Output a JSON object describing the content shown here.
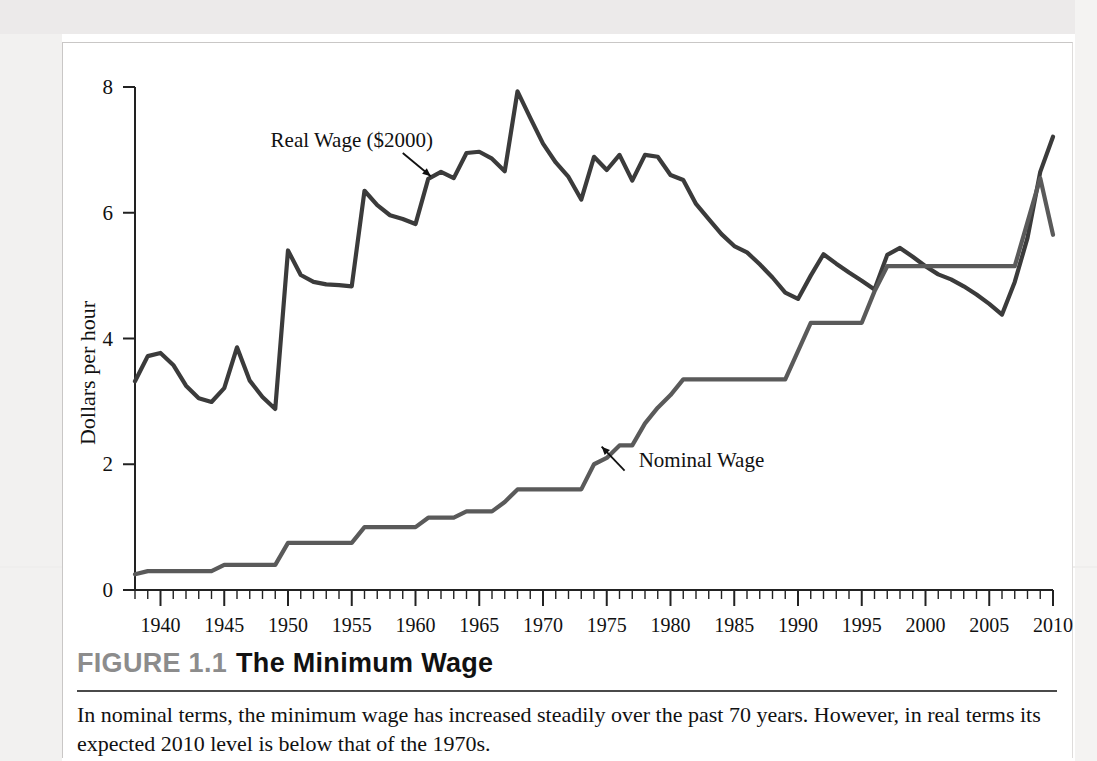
{
  "figure": {
    "number_label": "FIGURE 1.1",
    "title": "The Minimum Wage",
    "caption": "In nominal terms, the minimum wage has increased steadily over the past 70 years. However, in real terms its expected 2010 level is below that of the 1970s."
  },
  "chart_data": {
    "type": "line",
    "title": "The Minimum Wage",
    "xlabel": "",
    "ylabel": "Dollars per hour",
    "xlim": [
      1938,
      2010
    ],
    "ylim": [
      0,
      8
    ],
    "ytick_labels": [
      "0",
      "2",
      "4",
      "6",
      "8"
    ],
    "ytick_values": [
      0,
      2,
      4,
      6,
      8
    ],
    "xtick_labels": [
      "1940",
      "1945",
      "1950",
      "1955",
      "1960",
      "1965",
      "1970",
      "1975",
      "1980",
      "1985",
      "1990",
      "1995",
      "2000",
      "2005",
      "2010"
    ],
    "xtick_values": [
      1940,
      1945,
      1950,
      1955,
      1960,
      1965,
      1970,
      1975,
      1980,
      1985,
      1990,
      1995,
      2000,
      2005,
      2010
    ],
    "minor_tick_interval": 1,
    "grid": false,
    "legend_position": "inline-annotations",
    "colors": {
      "real_wage": "#3b3b3b",
      "nominal_wage": "#5a5a5a",
      "axis": "#222222",
      "figure_number": "#8c8c8c"
    },
    "annotations": [
      {
        "text": "Real Wage ($2000)",
        "points_to_series": "Real Wage ($2000)",
        "x": 1955.0,
        "y": 7.05
      },
      {
        "text": "Nominal Wage",
        "points_to_series": "Nominal Wage",
        "x": 1977.5,
        "y": 1.95
      }
    ],
    "series": [
      {
        "name": "Real Wage ($2000)",
        "color": "#3b3b3b",
        "x": [
          1938,
          1939,
          1940,
          1941,
          1942,
          1943,
          1944,
          1945,
          1946,
          1947,
          1948,
          1949,
          1950,
          1951,
          1952,
          1953,
          1954,
          1955,
          1956,
          1957,
          1958,
          1959,
          1960,
          1961,
          1962,
          1963,
          1964,
          1965,
          1966,
          1967,
          1968,
          1969,
          1970,
          1971,
          1972,
          1973,
          1974,
          1975,
          1976,
          1977,
          1978,
          1979,
          1980,
          1981,
          1982,
          1983,
          1984,
          1985,
          1986,
          1987,
          1988,
          1989,
          1990,
          1991,
          1992,
          1993,
          1994,
          1995,
          1996,
          1997,
          1998,
          1999,
          2000,
          2001,
          2002,
          2003,
          2004,
          2005,
          2006,
          2007,
          2008,
          2009,
          2010
        ],
        "y": [
          3.32,
          3.72,
          3.77,
          3.58,
          3.25,
          3.05,
          2.99,
          3.21,
          3.86,
          3.33,
          3.07,
          2.88,
          5.4,
          5.01,
          4.9,
          4.86,
          4.85,
          4.83,
          6.35,
          6.12,
          5.96,
          5.9,
          5.82,
          6.54,
          6.65,
          6.55,
          6.95,
          6.97,
          6.86,
          6.66,
          7.93,
          7.51,
          7.1,
          6.8,
          6.57,
          6.21,
          6.89,
          6.68,
          6.92,
          6.51,
          6.92,
          6.89,
          6.6,
          6.52,
          6.14,
          5.9,
          5.66,
          5.47,
          5.37,
          5.18,
          4.97,
          4.73,
          4.63,
          5.0,
          5.34,
          5.19,
          5.05,
          4.92,
          4.78,
          5.33,
          5.44,
          5.3,
          5.15,
          5.02,
          4.94,
          4.83,
          4.7,
          4.55,
          4.38,
          4.9,
          5.6,
          6.65,
          7.21
        ]
      },
      {
        "name": "Nominal Wage",
        "color": "#5a5a5a",
        "x": [
          1938,
          1939,
          1940,
          1941,
          1942,
          1943,
          1944,
          1945,
          1946,
          1947,
          1948,
          1949,
          1950,
          1951,
          1952,
          1953,
          1954,
          1955,
          1956,
          1957,
          1958,
          1959,
          1960,
          1961,
          1962,
          1963,
          1964,
          1965,
          1966,
          1967,
          1968,
          1969,
          1970,
          1971,
          1972,
          1973,
          1974,
          1975,
          1976,
          1977,
          1978,
          1979,
          1980,
          1981,
          1982,
          1983,
          1984,
          1985,
          1986,
          1987,
          1988,
          1989,
          1990,
          1991,
          1992,
          1993,
          1994,
          1995,
          1996,
          1997,
          1998,
          1999,
          2000,
          2001,
          2002,
          2003,
          2004,
          2005,
          2006,
          2007,
          2008,
          2009,
          2010
        ],
        "y": [
          0.25,
          0.3,
          0.3,
          0.3,
          0.3,
          0.3,
          0.3,
          0.4,
          0.4,
          0.4,
          0.4,
          0.4,
          0.75,
          0.75,
          0.75,
          0.75,
          0.75,
          0.75,
          1.0,
          1.0,
          1.0,
          1.0,
          1.0,
          1.15,
          1.15,
          1.15,
          1.25,
          1.25,
          1.25,
          1.4,
          1.6,
          1.6,
          1.6,
          1.6,
          1.6,
          1.6,
          2.0,
          2.1,
          2.3,
          2.3,
          2.65,
          2.9,
          3.1,
          3.35,
          3.35,
          3.35,
          3.35,
          3.35,
          3.35,
          3.35,
          3.35,
          3.35,
          3.8,
          4.25,
          4.25,
          4.25,
          4.25,
          4.25,
          4.75,
          5.15,
          5.15,
          5.15,
          5.15,
          5.15,
          5.15,
          5.15,
          5.15,
          5.15,
          5.15,
          5.15,
          5.85,
          6.55,
          5.65
        ]
      }
    ]
  }
}
